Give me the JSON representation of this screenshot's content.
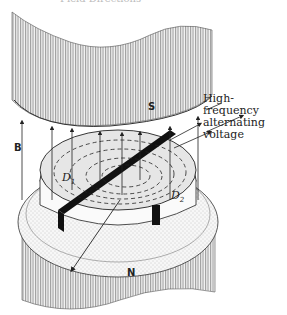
{
  "figure": {
    "title_partial": "Field Directions"
  },
  "labels": {
    "south_pole": "S",
    "north_pole": "N",
    "magnetic_field": "B",
    "dee_1": "D",
    "dee_1_sub": "1",
    "dee_2": "D",
    "dee_2_sub": "2",
    "voltage_line1": "High-frequency",
    "voltage_line2": "alternating",
    "voltage_line3": "voltage"
  },
  "colors": {
    "hatch": "#9a9a9a",
    "line": "#222222",
    "dee_fill": "#e8e8e8",
    "gap": "#111111"
  }
}
